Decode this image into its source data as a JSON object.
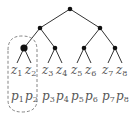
{
  "diagram": {
    "type": "binary-tree",
    "edge_color": "#333333",
    "node_color": "#111111",
    "group_box": {
      "style": "dashed-rounded",
      "encloses": [
        "z1",
        "z2",
        "p1",
        "p2"
      ]
    },
    "leaves": [
      {
        "z": "z",
        "zi": "1",
        "p": "p",
        "pi": "1",
        "x": 16
      },
      {
        "z": "z",
        "zi": "2",
        "p": "p",
        "pi": "2",
        "x": 30
      },
      {
        "z": "z",
        "zi": "3",
        "p": "p",
        "pi": "3",
        "x": 47
      },
      {
        "z": "z",
        "zi": "4",
        "p": "p",
        "pi": "4",
        "x": 61
      },
      {
        "z": "z",
        "zi": "5",
        "p": "p",
        "pi": "5",
        "x": 76
      },
      {
        "z": "z",
        "zi": "6",
        "p": "p",
        "pi": "6",
        "x": 90
      },
      {
        "z": "z",
        "zi": "7",
        "p": "p",
        "pi": "7",
        "x": 107
      },
      {
        "z": "z",
        "zi": "8",
        "p": "p",
        "pi": "8",
        "x": 121
      }
    ]
  }
}
